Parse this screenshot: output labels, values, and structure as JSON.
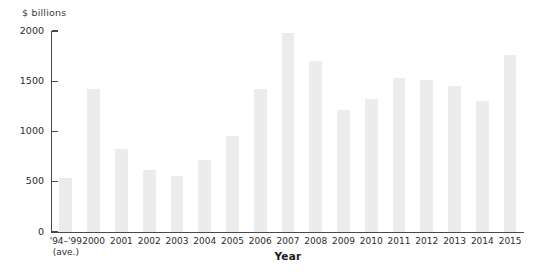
{
  "chart_data": {
    "type": "bar",
    "title": "",
    "subtitle": "",
    "xlabel": "Year",
    "ylabel": "$ billions",
    "y_unit_caption": "$ billions",
    "categories": [
      "'94–'99",
      "2000",
      "2001",
      "2002",
      "2003",
      "2004",
      "2005",
      "2006",
      "2007",
      "2008",
      "2009",
      "2010",
      "2011",
      "2012",
      "2013",
      "2014",
      "2015"
    ],
    "category_sublabels": [
      "(ave.)",
      "",
      "",
      "",
      "",
      "",
      "",
      "",
      "",
      "",
      "",
      "",
      "",
      "",
      "",
      "",
      ""
    ],
    "values": [
      540,
      1420,
      830,
      620,
      560,
      720,
      960,
      1420,
      1980,
      1700,
      1210,
      1320,
      1530,
      1510,
      1450,
      1300,
      1760
    ],
    "ylim": [
      0,
      2000
    ],
    "yticks": [
      0,
      500,
      1000,
      1500,
      2000
    ],
    "ytick_labels": [
      "0",
      "500",
      "1000",
      "1500",
      "2000"
    ],
    "grid": false,
    "legend": null,
    "legend_position": "none",
    "bar_color": "#ececed",
    "axis_color": "#4a4a4a",
    "text_color": "#2b2b2b"
  }
}
